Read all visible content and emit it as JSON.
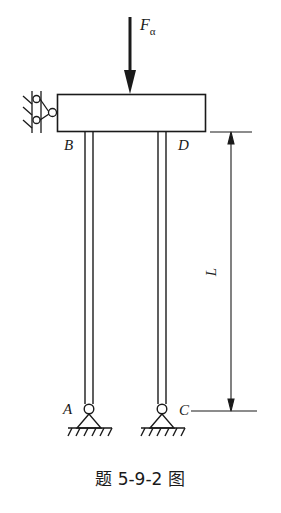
{
  "diagram": {
    "type": "structural-mechanics",
    "force": {
      "symbol": "F",
      "subscript": "α"
    },
    "points": {
      "A": "A",
      "B": "B",
      "C": "C",
      "D": "D"
    },
    "dimension": {
      "label": "L"
    },
    "caption": "题 5-9-2 图",
    "colors": {
      "stroke": "#1a1a1a",
      "background": "#ffffff"
    }
  }
}
